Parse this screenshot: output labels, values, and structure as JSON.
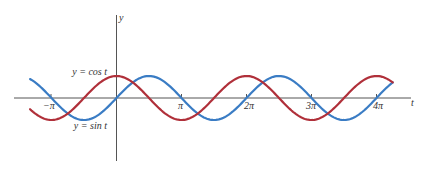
{
  "chart_data": {
    "type": "line",
    "title": "",
    "xlabel": "t",
    "ylabel": "y",
    "xlim_pi": [
      -1.33,
      4.25
    ],
    "ylim": [
      -1,
      1
    ],
    "grid": false,
    "legend": "inline labels",
    "x_ticks": [
      {
        "value_pi": -1,
        "label": "−π"
      },
      {
        "value_pi": 1,
        "label": "π"
      },
      {
        "value_pi": 2,
        "label": "2π"
      },
      {
        "value_pi": 3,
        "label": "3π"
      },
      {
        "value_pi": 4,
        "label": "4π"
      }
    ],
    "series": [
      {
        "name": "y = sin t",
        "function": "sin",
        "color": "#3a7cc4",
        "t_start_pi": -1.33,
        "t_end_pi": 4.25
      },
      {
        "name": "y = cos t",
        "function": "cos",
        "color": "#b0303a",
        "t_start_pi": -1.33,
        "t_end_pi": 4.25
      }
    ],
    "annotations": [
      {
        "text": "y = cos t",
        "near": "cos curve at t=0"
      },
      {
        "text": "y = sin t",
        "near": "sin curve at t=-π/2"
      }
    ]
  },
  "labels": {
    "y_axis": "y",
    "t_axis": "t",
    "cos_label": "y = cos t",
    "sin_label": "y = sin t",
    "tick_neg_pi": "−π",
    "tick_pi": "π",
    "tick_2pi": "2π",
    "tick_3pi": "3π",
    "tick_4pi": "4π"
  },
  "colors": {
    "axis": "#555555",
    "sin": "#3a7cc4",
    "cos": "#b0303a"
  }
}
